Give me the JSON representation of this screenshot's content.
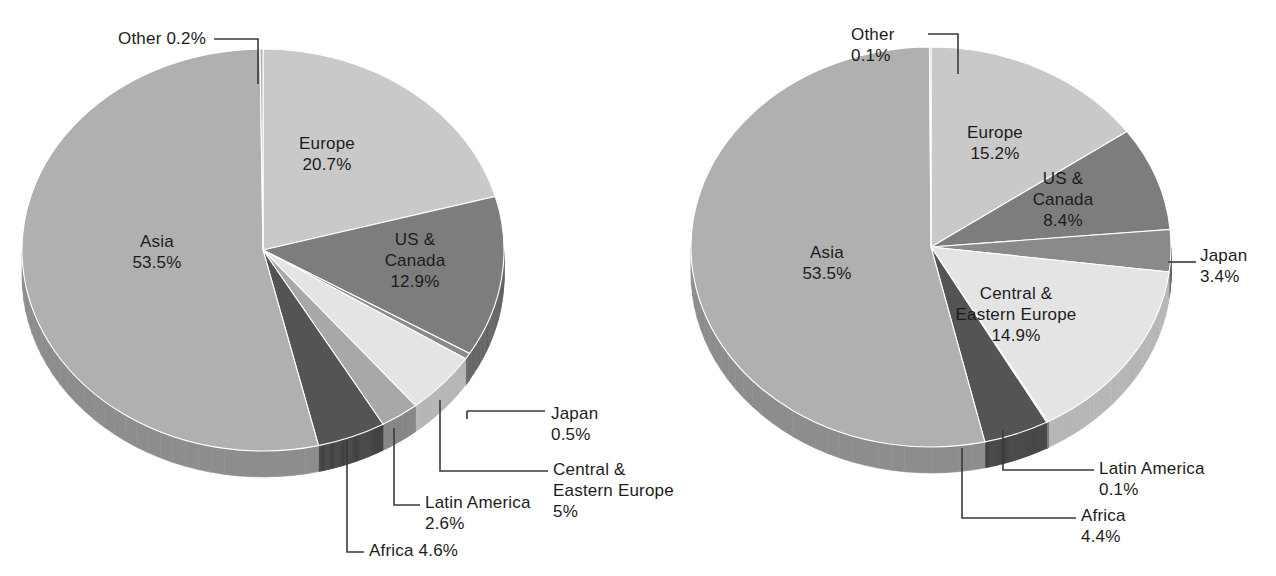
{
  "chart_data": [
    {
      "type": "pie",
      "title": "",
      "id": "left-pie",
      "three_d": true,
      "start_angle_deg": 0,
      "direction": "clockwise",
      "center": {
        "x": 263,
        "y": 250
      },
      "radius_x": 241,
      "radius_y": 201,
      "depth": 26,
      "categories": [
        "Europe",
        "US & Canada",
        "Japan",
        "Central & Eastern Europe",
        "Latin America",
        "Africa",
        "Asia",
        "Other"
      ],
      "values": [
        20.7,
        12.9,
        0.5,
        5.0,
        2.6,
        4.6,
        53.5,
        0.2
      ],
      "labels": [
        {
          "name": "Europe",
          "value": "20.7%",
          "text": "Europe\n20.7%",
          "placement": "inside"
        },
        {
          "name": "US & Canada",
          "value": "12.9%",
          "text": "US &\nCanada\n12.9%",
          "placement": "inside"
        },
        {
          "name": "Japan",
          "value": "0.5%",
          "text": "Japan\n0.5%",
          "placement": "leader"
        },
        {
          "name": "Central & Eastern Europe",
          "value": "5%",
          "text": "Central &\nEastern Europe\n5%",
          "placement": "leader"
        },
        {
          "name": "Latin America",
          "value": "2.6%",
          "text": "Latin America\n2.6%",
          "placement": "leader"
        },
        {
          "name": "Africa",
          "value": "4.6%",
          "text": "Africa 4.6%",
          "placement": "leader"
        },
        {
          "name": "Asia",
          "value": "53.5%",
          "text": "Asia\n53.5%",
          "placement": "inside"
        },
        {
          "name": "Other",
          "value": "0.2%",
          "text": "Other 0.2%",
          "placement": "leader"
        }
      ],
      "colors": [
        "#c9c9c9",
        "#7d7d7d",
        "#8a8a8a",
        "#e4e4e4",
        "#a8a8a8",
        "#545454",
        "#b0b0b0",
        "#b0b0b0"
      ]
    },
    {
      "type": "pie",
      "title": "",
      "id": "right-pie",
      "three_d": true,
      "start_angle_deg": 0,
      "direction": "clockwise",
      "center": {
        "x": 931,
        "y": 247
      },
      "radius_x": 240,
      "radius_y": 200,
      "depth": 26,
      "categories": [
        "Europe",
        "US & Canada",
        "Japan",
        "Central & Eastern Europe",
        "Latin America",
        "Africa",
        "Asia",
        "Other"
      ],
      "values": [
        15.2,
        8.4,
        3.4,
        14.9,
        0.1,
        4.4,
        53.5,
        0.1
      ],
      "labels": [
        {
          "name": "Europe",
          "value": "15.2%",
          "text": "Europe\n15.2%",
          "placement": "inside"
        },
        {
          "name": "US & Canada",
          "value": "8.4%",
          "text": "US &\nCanada\n8.4%",
          "placement": "inside"
        },
        {
          "name": "Japan",
          "value": "3.4%",
          "text": "Japan\n3.4%",
          "placement": "leader"
        },
        {
          "name": "Central & Eastern Europe",
          "value": "14.9%",
          "text": "Central &\nEastern Europe\n14.9%",
          "placement": "inside"
        },
        {
          "name": "Latin America",
          "value": "0.1%",
          "text": "Latin America\n0.1%",
          "placement": "leader"
        },
        {
          "name": "Africa",
          "value": "4.4%",
          "text": "Africa\n4.4%",
          "placement": "leader"
        },
        {
          "name": "Asia",
          "value": "53.5%",
          "text": "Asia\n53.5%",
          "placement": "inside"
        },
        {
          "name": "Other",
          "value": "0.1%",
          "text": "Other\n0.1%",
          "placement": "leader"
        }
      ],
      "colors": [
        "#c9c9c9",
        "#7d7d7d",
        "#8a8a8a",
        "#e4e4e4",
        "#a8a8a8",
        "#545454",
        "#b0b0b0",
        "#b0b0b0"
      ]
    }
  ],
  "left_chart": {
    "other_label": "Other 0.2%",
    "europe_label": "Europe\n20.7%",
    "us_canada_label": "US &\nCanada\n12.9%",
    "asia_label": "Asia\n53.5%",
    "japan_label": "Japan\n0.5%",
    "cee_label": "Central &\nEastern Europe\n5%",
    "latin_america_label": "Latin America\n2.6%",
    "africa_label": "Africa 4.6%"
  },
  "right_chart": {
    "other_label": "Other\n0.1%",
    "europe_label": "Europe\n15.2%",
    "us_canada_label": "US &\nCanada\n8.4%",
    "asia_label": "Asia\n53.5%",
    "japan_label": "Japan\n3.4%",
    "cee_label": "Central &\nEastern Europe\n14.9%",
    "latin_america_label": "Latin America\n0.1%",
    "africa_label": "Africa\n4.4%"
  }
}
